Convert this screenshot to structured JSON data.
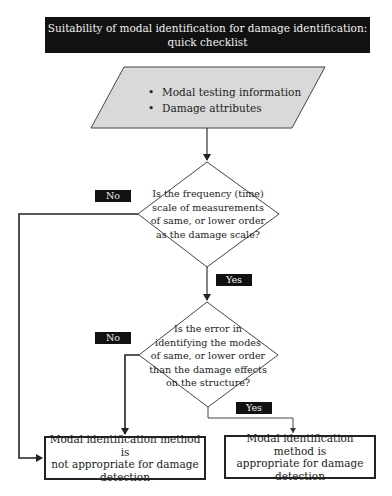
{
  "title": {
    "line1": "Suitability of modal identification for damage identification:",
    "line2": "quick checklist"
  },
  "input": {
    "items": [
      "Modal testing information",
      "Damage attributes"
    ],
    "bullet": "•",
    "fill_color": "#d9d9d9"
  },
  "decision1": {
    "lines": [
      "Is the frequency (time)",
      "scale of measurements",
      "of same, or lower order",
      "as the damage scale?"
    ],
    "no_label": "No",
    "yes_label": "Yes"
  },
  "decision2": {
    "lines": [
      "Is the error in",
      "identifying the modes",
      "of same, or lower order",
      "than the damage effects",
      "on the structure?"
    ],
    "no_label": "No",
    "yes_label": "Yes"
  },
  "outcomes": {
    "not_appropriate": [
      "Modal identification method is",
      "not appropriate for damage",
      "detection"
    ],
    "appropriate": [
      "Modal identification method is",
      "appropriate for damage",
      "detection"
    ]
  }
}
